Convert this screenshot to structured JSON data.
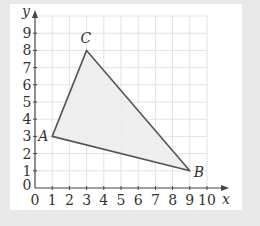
{
  "diagram": {
    "type": "coordinate-triangle",
    "axes": {
      "x_label": "x",
      "y_label": "y",
      "x_ticks": [
        "0",
        "1",
        "2",
        "3",
        "4",
        "5",
        "6",
        "7",
        "8",
        "9",
        "10"
      ],
      "y_ticks": [
        "0",
        "1",
        "2",
        "3",
        "4",
        "5",
        "6",
        "7",
        "8",
        "9"
      ],
      "xlim": [
        0,
        10
      ],
      "ylim": [
        0,
        9
      ],
      "grid": true
    },
    "points": [
      {
        "name": "A",
        "x": 1,
        "y": 3
      },
      {
        "name": "B",
        "x": 9,
        "y": 1
      },
      {
        "name": "C",
        "x": 3,
        "y": 8
      }
    ],
    "colors": {
      "background": "#e9e9e9",
      "card": "#ffffff",
      "grid": "#e3e3e3",
      "axis": "#444444",
      "triangle_fill": "#ececec",
      "triangle_stroke": "#555555"
    }
  }
}
